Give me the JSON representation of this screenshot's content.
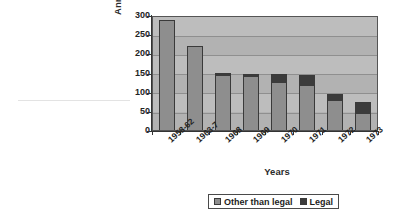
{
  "chart_data": {
    "type": "bar",
    "stacked": true,
    "title": "",
    "xlabel": "Years",
    "ylabel": "Annual numbers of deaths",
    "categories": [
      "1958-62",
      "1963-7",
      "1968",
      "1969",
      "1970",
      "1971",
      "1972",
      "1973"
    ],
    "series": [
      {
        "name": "Other than legal",
        "color": "#8e8e8e",
        "values": [
          292,
          222,
          147,
          144,
          128,
          120,
          78,
          45
        ]
      },
      {
        "name": "Legal",
        "color": "#3b3b3b",
        "values": [
          0,
          0,
          5,
          4,
          20,
          25,
          17,
          30
        ]
      }
    ],
    "totals": [
      292,
      222,
      152,
      148,
      148,
      145,
      95,
      75
    ],
    "ylim": [
      0,
      300
    ],
    "yticks": [
      0,
      50,
      100,
      150,
      200,
      250,
      300
    ],
    "ytick_labels": [
      "0",
      "50",
      "100",
      "150",
      "200",
      "250",
      "300"
    ],
    "grid": true,
    "grid_axis": "y",
    "legend_position": "bottom",
    "legend": [
      "Other than legal",
      "Legal"
    ],
    "plot_background": "#b2b2b2"
  },
  "axes": {
    "y_title": "Annual numbers of deaths",
    "x_title": "Years"
  },
  "legend": {
    "items": [
      {
        "label": "Other than legal"
      },
      {
        "label": "Legal"
      }
    ]
  }
}
